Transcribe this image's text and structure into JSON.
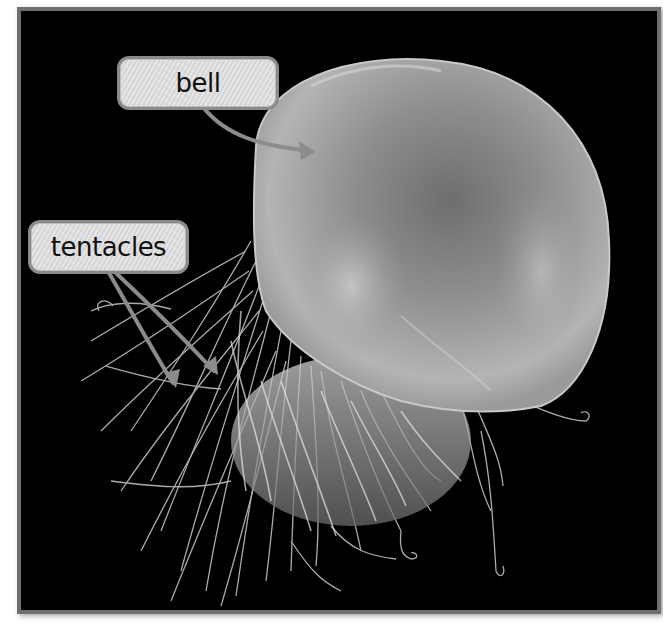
{
  "figure": {
    "background_color": "#000000",
    "frame_color": "#6f6f6f",
    "label_fill": "#dcdcdc",
    "label_border": "#8a8a8a",
    "arrow_color": "#8c8c8c"
  },
  "labels": [
    {
      "id": "bell",
      "text": "bell"
    },
    {
      "id": "tentacles",
      "text": "tentacles"
    }
  ]
}
